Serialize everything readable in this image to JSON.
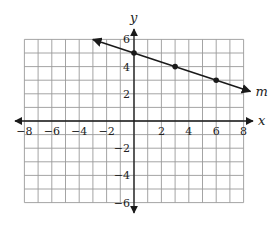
{
  "chart_data": {
    "type": "line",
    "title": "",
    "xlabel": "x",
    "ylabel": "y",
    "xlim": [
      -8,
      8
    ],
    "ylim": [
      -6,
      6
    ],
    "grid": true,
    "grid_step": 1,
    "x_tick_labels": [
      "−8",
      "−6",
      "−4",
      "−2",
      "2",
      "4",
      "6",
      "8"
    ],
    "x_tick_values": [
      -8,
      -6,
      -4,
      -2,
      2,
      4,
      6,
      8
    ],
    "y_tick_labels": [
      "6",
      "4",
      "2",
      "−2",
      "−4",
      "−6"
    ],
    "y_tick_values": [
      6,
      4,
      2,
      -2,
      -4,
      -6
    ],
    "series": [
      {
        "name": "m",
        "label": "m",
        "equation": "y = -x/3 + 5",
        "slope": -0.3333,
        "intercept": 5,
        "x_range": [
          -3,
          8.5
        ],
        "points": [
          {
            "x": 0,
            "y": 5
          },
          {
            "x": 3,
            "y": 4
          },
          {
            "x": 6,
            "y": 3
          }
        ]
      }
    ],
    "legend": "none"
  },
  "colors": {
    "grid": "#9a9a9a",
    "axis": "#1a1a1a",
    "line": "#1a1a1a",
    "background": "#ffffff"
  }
}
